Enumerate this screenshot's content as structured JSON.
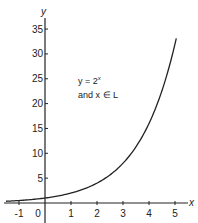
{
  "chart_data": {
    "type": "line",
    "title": "",
    "xlabel": "x",
    "ylabel": "y",
    "xlim": [
      -1.5,
      5.6
    ],
    "ylim": [
      -3,
      38
    ],
    "x_ticks": [
      -1,
      0,
      1,
      2,
      3,
      4,
      5
    ],
    "x_tick_labels": [
      "-1",
      "0",
      "1",
      "2",
      "3",
      "4",
      "5"
    ],
    "y_ticks": [
      5,
      10,
      15,
      20,
      25,
      30,
      35
    ],
    "y_tick_labels": [
      "5",
      "10",
      "15",
      "20",
      "25",
      "30",
      "35"
    ],
    "grid": false,
    "series": [
      {
        "name": "y = 2^x",
        "function": "2^x",
        "x_range": [
          -1.5,
          5.05
        ],
        "x": [
          -1.5,
          -1,
          0,
          1,
          2,
          3,
          4,
          5,
          5.05
        ],
        "y": [
          0.35,
          0.5,
          1,
          2,
          4,
          8,
          16,
          32,
          33.1
        ]
      }
    ],
    "annotations": [
      {
        "line1_base": "y = 2",
        "line1_sup": "x",
        "line2": "and  x ∈ L",
        "position": "upper-middle"
      }
    ]
  }
}
